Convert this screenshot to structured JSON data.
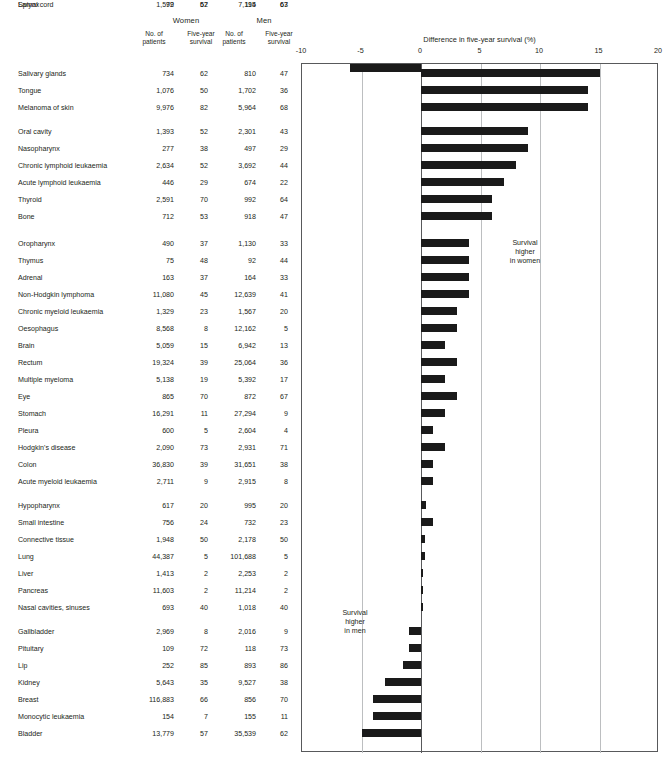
{
  "header": {
    "group_women": "Women",
    "group_men": "Men",
    "col_no_patients": "No. of\npatients",
    "col_five_year": "Five-year\nsurvival",
    "women_patients_label": "No. of patients",
    "women_survival_label": "Five-year survival",
    "men_patients_label": "No. of patients",
    "men_survival_label": "Five-year survival"
  },
  "chart_header": {
    "title": "Difference in five-year survival (%)",
    "annotation_women": "Survival\nhigher\nin women",
    "annotation_men": "Survival\nhigher\nin men"
  },
  "chart_data": {
    "type": "bar",
    "orientation": "horizontal",
    "title": "Difference in five-year survival (%)",
    "xlabel": "Difference in five-year survival (%)",
    "ylabel": "",
    "xlim": [
      -10,
      20
    ],
    "xticks": [
      -10,
      -5,
      0,
      5,
      10,
      15,
      20
    ],
    "xtick_labels": [
      "-10",
      "-5",
      "0",
      "5",
      "10",
      "15",
      "20"
    ],
    "grid": true,
    "legend": "none",
    "annotations": [
      "Survival higher in women",
      "Survival higher in men"
    ],
    "categories": [
      "Salivary glands",
      "Tongue",
      "Melanoma of skin",
      "Oral cavity",
      "Nasopharynx",
      "Chronic lymphoid leukaemia",
      "Acute lymphoid leukaemia",
      "Thyroid",
      "Bone",
      "Oropharynx",
      "Thymus",
      "Adrenal",
      "Non-Hodgkin lymphoma",
      "Chronic myeloid leukaemia",
      "Oesophagus",
      "Brain",
      "Rectum",
      "Multiple myeloma",
      "Eye",
      "Stomach",
      "Pleura",
      "Hodgkin's disease",
      "Colon",
      "Acute myeloid leukaemia",
      "Hypopharynx",
      "Small intestine",
      "Connective tissue",
      "Lung",
      "Liver",
      "Pancreas",
      "Nasal cavities, sinuses",
      "Gallbladder",
      "Pituitary",
      "Lip",
      "Kidney",
      "Breast",
      "Monocytic leukaemia",
      "Bladder",
      "Spinal cord",
      "Larynx"
    ],
    "values": [
      15,
      14,
      14,
      9,
      9,
      8,
      7,
      6,
      6,
      4,
      4,
      4,
      4,
      3,
      3,
      2,
      3,
      2,
      3,
      2,
      1,
      2,
      1,
      1,
      0,
      1,
      0,
      0,
      0,
      0,
      0,
      -1,
      -1,
      -1,
      -3,
      -4,
      -4,
      -5,
      -5,
      -6
    ]
  },
  "axis": {
    "ticks": [
      "-10",
      "-5",
      "0",
      "5",
      "10",
      "15",
      "20"
    ]
  },
  "rows": [
    {
      "site": "Salivary glands",
      "w_pat": "734",
      "w_surv": "62",
      "m_pat": "810",
      "m_surv": "47",
      "diff": 15
    },
    {
      "site": "Tongue",
      "w_pat": "1,076",
      "w_surv": "50",
      "m_pat": "1,702",
      "m_surv": "36",
      "diff": 14
    },
    {
      "site": "Melanoma of skin",
      "w_pat": "9,976",
      "w_surv": "82",
      "m_pat": "5,964",
      "m_surv": "68",
      "diff": 14
    },
    {
      "site": "Oral cavity",
      "w_pat": "1,393",
      "w_surv": "52",
      "m_pat": "2,301",
      "m_surv": "43",
      "diff": 9
    },
    {
      "site": "Nasopharynx",
      "w_pat": "277",
      "w_surv": "38",
      "m_pat": "497",
      "m_surv": "29",
      "diff": 9
    },
    {
      "site": "Chronic lymphoid leukaemia",
      "w_pat": "2,634",
      "w_surv": "52",
      "m_pat": "3,692",
      "m_surv": "44",
      "diff": 8
    },
    {
      "site": "Acute lymphoid leukaemia",
      "w_pat": "446",
      "w_surv": "29",
      "m_pat": "674",
      "m_surv": "22",
      "diff": 7
    },
    {
      "site": "Thyroid",
      "w_pat": "2,591",
      "w_surv": "70",
      "m_pat": "992",
      "m_surv": "64",
      "diff": 6
    },
    {
      "site": "Bone",
      "w_pat": "712",
      "w_surv": "53",
      "m_pat": "918",
      "m_surv": "47",
      "diff": 6
    },
    {
      "site": "Oropharynx",
      "w_pat": "490",
      "w_surv": "37",
      "m_pat": "1,130",
      "m_surv": "33",
      "diff": 4
    },
    {
      "site": "Thymus",
      "w_pat": "75",
      "w_surv": "48",
      "m_pat": "92",
      "m_surv": "44",
      "diff": 4
    },
    {
      "site": "Adrenal",
      "w_pat": "163",
      "w_surv": "37",
      "m_pat": "164",
      "m_surv": "33",
      "diff": 4
    },
    {
      "site": "Non-Hodgkin lymphoma",
      "w_pat": "11,080",
      "w_surv": "45",
      "m_pat": "12,639",
      "m_surv": "41",
      "diff": 4
    },
    {
      "site": "Chronic myeloid leukaemia",
      "w_pat": "1,329",
      "w_surv": "23",
      "m_pat": "1,567",
      "m_surv": "20",
      "diff": 3
    },
    {
      "site": "Oesophagus",
      "w_pat": "8,568",
      "w_surv": "8",
      "m_pat": "12,162",
      "m_surv": "5",
      "diff": 3
    },
    {
      "site": "Brain",
      "w_pat": "5,059",
      "w_surv": "15",
      "m_pat": "6,942",
      "m_surv": "13",
      "diff": 2
    },
    {
      "site": "Rectum",
      "w_pat": "19,324",
      "w_surv": "39",
      "m_pat": "25,064",
      "m_surv": "36",
      "diff": 3
    },
    {
      "site": "Multiple myeloma",
      "w_pat": "5,138",
      "w_surv": "19",
      "m_pat": "5,392",
      "m_surv": "17",
      "diff": 2
    },
    {
      "site": "Eye",
      "w_pat": "865",
      "w_surv": "70",
      "m_pat": "872",
      "m_surv": "67",
      "diff": 3
    },
    {
      "site": "Stomach",
      "w_pat": "16,291",
      "w_surv": "11",
      "m_pat": "27,294",
      "m_surv": "9",
      "diff": 2
    },
    {
      "site": "Pleura",
      "w_pat": "600",
      "w_surv": "5",
      "m_pat": "2,604",
      "m_surv": "4",
      "diff": 1
    },
    {
      "site": "Hodgkin's disease",
      "w_pat": "2,090",
      "w_surv": "73",
      "m_pat": "2,931",
      "m_surv": "71",
      "diff": 2
    },
    {
      "site": "Colon",
      "w_pat": "36,830",
      "w_surv": "39",
      "m_pat": "31,651",
      "m_surv": "38",
      "diff": 1
    },
    {
      "site": "Acute myeloid leukaemia",
      "w_pat": "2,711",
      "w_surv": "9",
      "m_pat": "2,915",
      "m_surv": "8",
      "diff": 1
    },
    {
      "site": "Hypopharynx",
      "w_pat": "617",
      "w_surv": "20",
      "m_pat": "995",
      "m_surv": "20",
      "diff": 0.4
    },
    {
      "site": "Small intestine",
      "w_pat": "756",
      "w_surv": "24",
      "m_pat": "732",
      "m_surv": "23",
      "diff": 1
    },
    {
      "site": "Connective tissue",
      "w_pat": "1,948",
      "w_surv": "50",
      "m_pat": "2,178",
      "m_surv": "50",
      "diff": 0.3
    },
    {
      "site": "Lung",
      "w_pat": "44,387",
      "w_surv": "5",
      "m_pat": "101,688",
      "m_surv": "5",
      "diff": 0.3
    },
    {
      "site": "Liver",
      "w_pat": "1,413",
      "w_surv": "2",
      "m_pat": "2,253",
      "m_surv": "2",
      "diff": 0.2
    },
    {
      "site": "Pancreas",
      "w_pat": "11,603",
      "w_surv": "2",
      "m_pat": "11,214",
      "m_surv": "2",
      "diff": 0.2
    },
    {
      "site": "Nasal cavities, sinuses",
      "w_pat": "693",
      "w_surv": "40",
      "m_pat": "1,018",
      "m_surv": "40",
      "diff": 0.2
    },
    {
      "site": "Gallbladder",
      "w_pat": "2,969",
      "w_surv": "8",
      "m_pat": "2,016",
      "m_surv": "9",
      "diff": -1
    },
    {
      "site": "Pituitary",
      "w_pat": "109",
      "w_surv": "72",
      "m_pat": "118",
      "m_surv": "73",
      "diff": -1
    },
    {
      "site": "Lip",
      "w_pat": "252",
      "w_surv": "85",
      "m_pat": "893",
      "m_surv": "86",
      "diff": -1.5
    },
    {
      "site": "Kidney",
      "w_pat": "5,643",
      "w_surv": "35",
      "m_pat": "9,527",
      "m_surv": "38",
      "diff": -3
    },
    {
      "site": "Breast",
      "w_pat": "116,883",
      "w_surv": "66",
      "m_pat": "856",
      "m_surv": "70",
      "diff": -4
    },
    {
      "site": "Monocytic leukaemia",
      "w_pat": "154",
      "w_surv": "7",
      "m_pat": "155",
      "m_surv": "11",
      "diff": -4
    },
    {
      "site": "Bladder",
      "w_pat": "13,779",
      "w_surv": "57",
      "m_pat": "35,539",
      "m_surv": "62",
      "diff": -5
    },
    {
      "site": "Spinal cord",
      "w_pat": "79",
      "w_surv": "62",
      "m_pat": "114",
      "m_surv": "67",
      "diff": -5
    },
    {
      "site": "Larynx",
      "w_pat": "1,592",
      "w_surv": "57",
      "m_pat": "7,195",
      "m_surv": "63",
      "diff": -6
    }
  ],
  "layout": {
    "row_tops": [
      69,
      86,
      103,
      127,
      144,
      161,
      178,
      195,
      212,
      239,
      256,
      273,
      290,
      307,
      324,
      341,
      358,
      375,
      392,
      409,
      426,
      443,
      460,
      477,
      501,
      518,
      535,
      552,
      569,
      586,
      603,
      627,
      644,
      661,
      678,
      695,
      712,
      729
    ],
    "group_breaks": [
      3,
      9,
      24,
      31,
      38
    ]
  },
  "colors": {
    "bar": "#1a1a1a",
    "grid": "#bcbec0",
    "axis": "#58595b",
    "text": "#231f20",
    "background": "#ffffff"
  }
}
